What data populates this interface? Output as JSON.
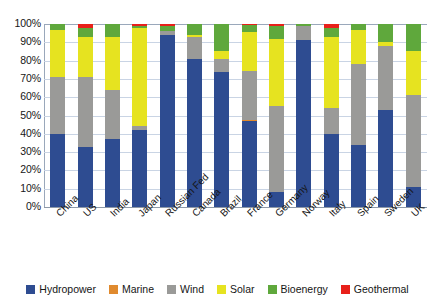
{
  "chart_data": {
    "type": "bar",
    "subtype": "stacked-percentage-column",
    "title": "",
    "subtitle": "",
    "xlabel": "",
    "ylabel": "",
    "ylim": [
      0,
      100
    ],
    "yticks": [
      "0%",
      "10%",
      "20%",
      "30%",
      "40%",
      "50%",
      "60%",
      "70%",
      "80%",
      "90%",
      "100%"
    ],
    "ytick_values": [
      0,
      10,
      20,
      30,
      40,
      50,
      60,
      70,
      80,
      90,
      100
    ],
    "grid": true,
    "grid_axis": "y",
    "legend_position": "bottom",
    "units": "percent",
    "categories": [
      "China",
      "US",
      "India",
      "Japan",
      "Russian Fed",
      "Canada",
      "Brazil",
      "France",
      "Germany",
      "Norway",
      "Italy",
      "Spain",
      "Sweden",
      "UK"
    ],
    "series": [
      {
        "name": "Hydropower",
        "color": "#2E4C91",
        "values": [
          40,
          33,
          37,
          42,
          94,
          81,
          74,
          47,
          8,
          91,
          40,
          34,
          53,
          11
        ]
      },
      {
        "name": "Marine",
        "color": "#E08A2E",
        "values": [
          0,
          0,
          0,
          0,
          0,
          0,
          0,
          0.4,
          0,
          0,
          0,
          0,
          0,
          0
        ]
      },
      {
        "name": "Wind",
        "color": "#9A9A98",
        "values": [
          31,
          38,
          27,
          2,
          2,
          12,
          7,
          27,
          47,
          8,
          14,
          44,
          35,
          50
        ]
      },
      {
        "name": "Solar",
        "color": "#E6E320",
        "values": [
          26,
          22,
          29,
          54,
          0,
          1,
          4,
          21,
          37,
          0,
          39,
          19,
          2,
          24
        ]
      },
      {
        "name": "Bioenergy",
        "color": "#5FA83C",
        "values": [
          3,
          5,
          7,
          1,
          3,
          6,
          15,
          4,
          7,
          1,
          5,
          3,
          10,
          15
        ]
      },
      {
        "name": "Geothermal",
        "color": "#E8201A",
        "values": [
          0,
          2,
          0,
          1,
          1,
          0,
          0,
          0.6,
          1,
          0,
          2,
          0,
          0,
          0
        ]
      }
    ]
  },
  "legend": {
    "items": [
      {
        "label": "Hydropower",
        "color": "#2E4C91"
      },
      {
        "label": "Marine",
        "color": "#E08A2E"
      },
      {
        "label": "Wind",
        "color": "#9A9A98"
      },
      {
        "label": "Solar",
        "color": "#E6E320"
      },
      {
        "label": "Bioenergy",
        "color": "#5FA83C"
      },
      {
        "label": "Geothermal",
        "color": "#E8201A"
      }
    ]
  }
}
